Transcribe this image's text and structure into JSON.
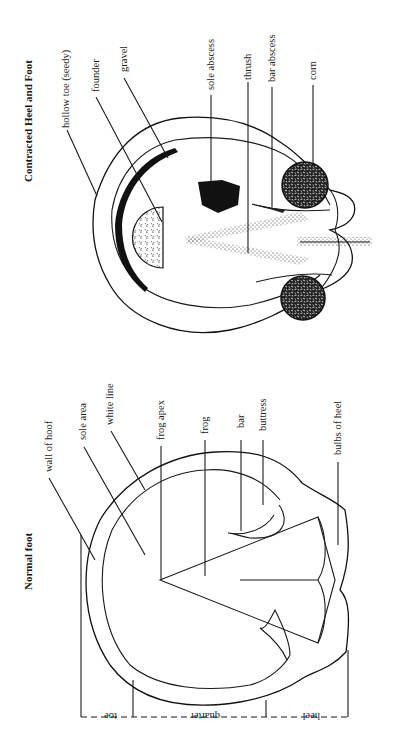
{
  "figures": [
    {
      "title": "Contracted Heel and Foot",
      "labels": [
        "hollow toe (seedy)",
        "founder",
        "gravel",
        "sole abscess",
        "thrush",
        "bar abscess",
        "corn"
      ]
    },
    {
      "title": "Normal foot",
      "labels": [
        "wall of hoof",
        "sole area",
        "white line",
        "frog apex",
        "frog",
        "bar",
        "buttress",
        "bulbs of heel"
      ],
      "dimensions": [
        "toe",
        "quarter",
        "heel"
      ]
    }
  ],
  "colors": {
    "ink": "#1a1a1a",
    "paper": "#ffffff"
  }
}
